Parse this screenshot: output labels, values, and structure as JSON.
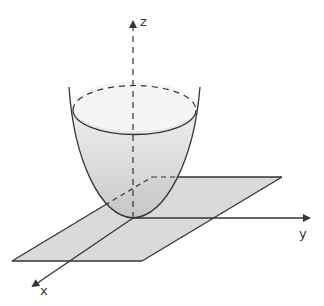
{
  "diagram": {
    "axes": {
      "x": {
        "label": "x"
      },
      "y": {
        "label": "y"
      },
      "z": {
        "label": "z"
      }
    },
    "colors": {
      "stroke": "#333333",
      "plane_fill": "#d9d9d9",
      "surface_fill_top": "#f0f0f0",
      "surface_fill_bottom": "#c8c8c8"
    },
    "elements": [
      "xy-plane",
      "paraboloid-surface",
      "rim-ellipse",
      "x-axis",
      "y-axis",
      "z-axis"
    ]
  }
}
